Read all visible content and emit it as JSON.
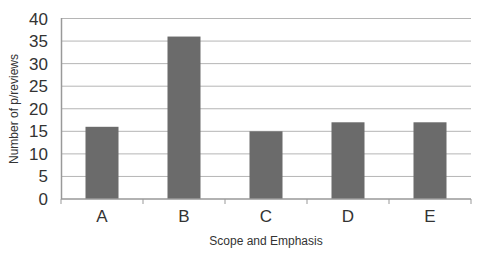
{
  "chart_data": {
    "type": "bar",
    "title": "",
    "categories": [
      "A",
      "B",
      "C",
      "D",
      "E"
    ],
    "values": [
      16,
      36,
      15,
      17,
      17
    ],
    "xlabel": "Scope and Emphasis",
    "ylabel": "Number of p/reviews",
    "ylim": [
      0,
      40
    ],
    "yticks": [
      0,
      5,
      10,
      15,
      20,
      25,
      30,
      35,
      40
    ],
    "grid": true,
    "legend": null,
    "bar_color": "#6b6b6b",
    "grid_color": "#b5b5b5",
    "axis_color": "#999999"
  }
}
